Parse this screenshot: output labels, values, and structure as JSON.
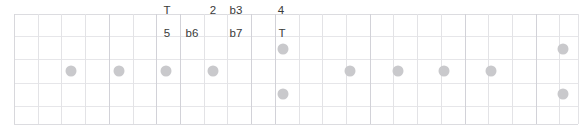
{
  "diagram": {
    "type": "fretboard-scale-diagram",
    "width": 585,
    "height": 133,
    "background_color": "#ffffff",
    "grid": {
      "line_color": "#e3e3e6",
      "edge_color": "#dcdce0",
      "nut_x": 14,
      "right_edge_x": 578,
      "fret_positions": [
        14,
        38,
        61,
        85,
        109,
        133,
        156,
        180,
        204,
        227,
        251,
        275,
        299,
        322,
        346,
        370,
        393,
        417,
        441,
        465,
        488,
        512,
        536,
        559,
        578
      ],
      "string_positions": [
        14,
        36,
        59,
        83,
        106,
        124
      ],
      "major_fret_positions": [
        14,
        109,
        156,
        180,
        251,
        275,
        370,
        465,
        536
      ]
    },
    "dots": {
      "color": "#c9c9cc",
      "diameter": 11,
      "items": [
        {
          "name": "note-dot-1",
          "x": 71,
          "y": 71
        },
        {
          "name": "note-dot-2",
          "x": 119,
          "y": 71
        },
        {
          "name": "note-dot-3",
          "x": 166,
          "y": 71
        },
        {
          "name": "note-dot-4",
          "x": 213,
          "y": 71
        },
        {
          "name": "note-dot-5",
          "x": 283,
          "y": 49
        },
        {
          "name": "note-dot-6",
          "x": 283,
          "y": 94
        },
        {
          "name": "note-dot-7",
          "x": 350,
          "y": 71
        },
        {
          "name": "note-dot-8",
          "x": 398,
          "y": 71
        },
        {
          "name": "note-dot-9",
          "x": 444,
          "y": 71
        },
        {
          "name": "note-dot-10",
          "x": 491,
          "y": 71
        },
        {
          "name": "note-dot-11",
          "x": 563,
          "y": 49
        },
        {
          "name": "note-dot-12",
          "x": 563,
          "y": 94
        }
      ]
    },
    "labels": [
      {
        "name": "interval-label-tonic-upper",
        "text": "T",
        "x": 167,
        "y": 11
      },
      {
        "name": "interval-label-2",
        "text": "2",
        "x": 213,
        "y": 11
      },
      {
        "name": "interval-label-b3",
        "text": "b3",
        "x": 236,
        "y": 11
      },
      {
        "name": "interval-label-4",
        "text": "4",
        "x": 281,
        "y": 11
      },
      {
        "name": "interval-label-5",
        "text": "5",
        "x": 167,
        "y": 34
      },
      {
        "name": "interval-label-b6",
        "text": "b6",
        "x": 192,
        "y": 34
      },
      {
        "name": "interval-label-b7",
        "text": "b7",
        "x": 236,
        "y": 34
      },
      {
        "name": "interval-label-tonic-lower",
        "text": "T",
        "x": 282,
        "y": 34
      }
    ]
  }
}
